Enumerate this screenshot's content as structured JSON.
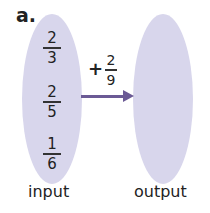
{
  "label": "a.",
  "input": {
    "caption": "input",
    "values": [
      {
        "num": "2",
        "den": "3"
      },
      {
        "num": "2",
        "den": "5"
      },
      {
        "num": "1",
        "den": "6"
      }
    ]
  },
  "operation": {
    "operator": "+",
    "num": "2",
    "den": "9"
  },
  "output": {
    "caption": "output"
  },
  "colors": {
    "oval": "#d8d6ec",
    "arrow": "#6b5a95"
  }
}
